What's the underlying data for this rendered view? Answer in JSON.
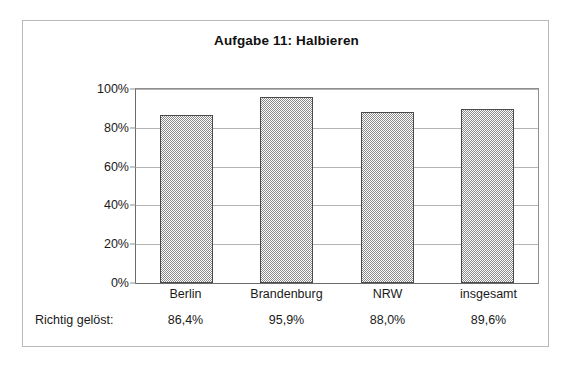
{
  "chart_data": {
    "type": "bar",
    "title": "Aufgabe 11: Halbieren",
    "xlabel": "",
    "ylabel": "",
    "categories": [
      "Berlin",
      "Brandenburg",
      "NRW",
      "insgesamt"
    ],
    "values": [
      86.4,
      95.9,
      88.0,
      89.6
    ],
    "value_labels": [
      "86,4%",
      "95,9%",
      "88,0%",
      "89,6%"
    ],
    "ylim": [
      0,
      100
    ],
    "ytick_labels": [
      "0%",
      "20%",
      "40%",
      "60%",
      "80%",
      "100%"
    ],
    "ytick_values": [
      0,
      20,
      40,
      60,
      80,
      100
    ],
    "grid": true,
    "legend": "none",
    "bar_fill": "#8a8a8a",
    "bar_border": "#4a4a4a",
    "gridline_color": "#b4b4b4",
    "frame_color": "#b9b9b9"
  },
  "table": {
    "row_label": "Richtig gelöst:"
  }
}
